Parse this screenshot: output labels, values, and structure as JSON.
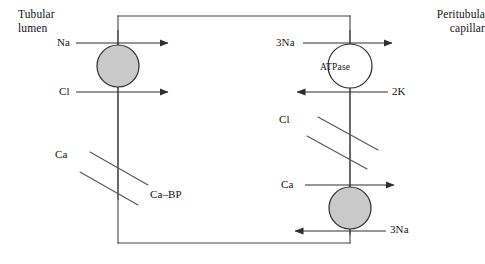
{
  "diagram": {
    "compartments": {
      "left_label": "Tubular\nlumen",
      "left_label_line1": "Tubular",
      "left_label_line2": "lumen",
      "right_label_line1": "Peritubula",
      "right_label_line2": "capillar"
    },
    "apical_membrane": {
      "transporters": [
        {
          "id": "na-cl-cotransporter",
          "shape": "circle",
          "fill": "#c9c9c9",
          "labels": [
            {
              "text": "Na",
              "direction": "into-cell"
            },
            {
              "text": "Cl",
              "direction": "into-cell"
            }
          ]
        },
        {
          "id": "ca-channel",
          "shape": "diagonal-channel",
          "labels": [
            {
              "text": "Ca",
              "direction": "into-cell"
            },
            {
              "text": "Ca–BP",
              "direction": "none"
            }
          ]
        }
      ]
    },
    "basolateral_membrane": {
      "transporters": [
        {
          "id": "na-k-atpase",
          "shape": "circle",
          "fill": "#ffffff",
          "name": "ATPase",
          "labels": [
            {
              "text": "3Na",
              "direction": "out-of-cell"
            },
            {
              "text": "2K",
              "direction": "into-cell"
            }
          ]
        },
        {
          "id": "cl-channel",
          "shape": "diagonal-channel",
          "labels": [
            {
              "text": "Cl",
              "direction": "out-of-cell"
            }
          ]
        },
        {
          "id": "na-ca-exchanger",
          "shape": "circle",
          "fill": "#c9c9c9",
          "labels": [
            {
              "text": "Ca",
              "direction": "out-of-cell"
            },
            {
              "text": "3Na",
              "direction": "into-cell"
            }
          ]
        }
      ]
    },
    "colors": {
      "stroke": "#3a3a3a",
      "shaded_fill": "#c9c9c9",
      "open_fill": "#ffffff",
      "text": "#141414",
      "background": "#ffffff"
    }
  }
}
